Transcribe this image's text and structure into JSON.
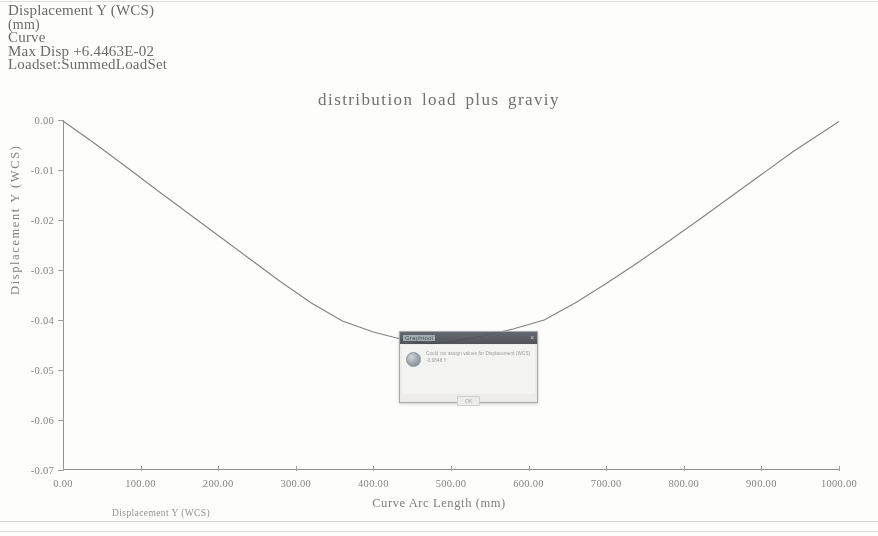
{
  "header": {
    "line1": "Displacement Y (WCS)",
    "line2": "(mm)",
    "line3": "Curve",
    "line4": "Max Disp  +6.4463E-02",
    "line5": "Loadset:SummedLoadSet"
  },
  "axes": {
    "x_title": "Curve Arc Length (mm)",
    "y_title": "Displacement Y (WCS)"
  },
  "legend": {
    "series_label": "Displacement Y (WCS)"
  },
  "dialog": {
    "title": "Graphtool",
    "message": "Could not assign values for\nDisplacement (WCS) -0.0648 Y",
    "ok_label": "OK",
    "close_label": "×"
  },
  "chart_data": {
    "type": "line",
    "title": "distribution  load  plus  graviy",
    "xlabel": "Curve Arc Length (mm)",
    "ylabel": "Displacement Y (WCS)",
    "xlim": [
      0,
      1000
    ],
    "ylim": [
      -0.07,
      0.0
    ],
    "grid": false,
    "legend_position": "bottom-left",
    "xticks": [
      "0.00",
      "100.00",
      "200.00",
      "300.00",
      "400.00",
      "500.00",
      "600.00",
      "700.00",
      "800.00",
      "900.00",
      "1000.00"
    ],
    "xtick_values": [
      0,
      100,
      200,
      300,
      400,
      500,
      600,
      700,
      800,
      900,
      1000
    ],
    "yticks": [
      "0.00",
      "-0.01",
      "-0.02",
      "-0.03",
      "-0.04",
      "-0.05",
      "-0.06",
      "-0.07"
    ],
    "ytick_values": [
      0.0,
      -0.01,
      -0.02,
      -0.03,
      -0.04,
      -0.05,
      -0.06,
      -0.07
    ],
    "series": [
      {
        "name": "Displacement Y (WCS)",
        "x": [
          0,
          40,
          80,
          120,
          160,
          200,
          240,
          280,
          320,
          360,
          400,
          440,
          470,
          500,
          540,
          580,
          620,
          660,
          700,
          740,
          780,
          820,
          860,
          900,
          940,
          1000
        ],
        "y": [
          -0.0002,
          -0.0046,
          -0.0092,
          -0.0139,
          -0.0185,
          -0.0231,
          -0.0277,
          -0.0323,
          -0.0366,
          -0.0402,
          -0.0424,
          -0.044,
          -0.0448,
          -0.0443,
          -0.0432,
          -0.0418,
          -0.04,
          -0.0366,
          -0.0327,
          -0.0286,
          -0.0243,
          -0.0199,
          -0.0154,
          -0.0109,
          -0.0064,
          -0.0003
        ]
      }
    ]
  }
}
